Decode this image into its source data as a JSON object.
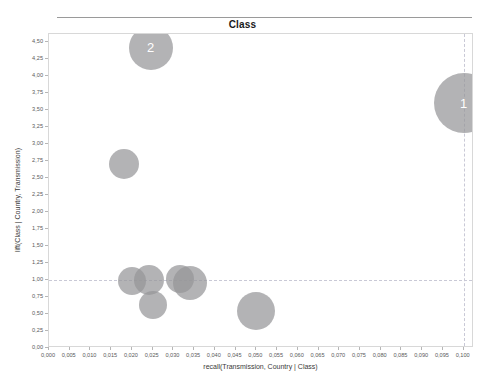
{
  "chart_data": {
    "type": "scatter",
    "title": "Class",
    "xlabel": "recall(Transmission, Country | Class)",
    "ylabel": "lift(Class | Country, Transmission)",
    "xlim": [
      0.0,
      0.1025
    ],
    "ylim": [
      0.0,
      4.62
    ],
    "grid": true,
    "grid_lines": {
      "horizontal": [
        1.0
      ],
      "vertical": [
        0.1
      ]
    },
    "legend": "none",
    "decimal_separator": ",",
    "xticks": [
      "0,000",
      "0,005",
      "0,010",
      "0,015",
      "0,020",
      "0,025",
      "0,030",
      "0,035",
      "0,040",
      "0,045",
      "0,050",
      "0,055",
      "0,060",
      "0,065",
      "0,070",
      "0,075",
      "0,080",
      "0,085",
      "0,090",
      "0,095",
      "0,100"
    ],
    "xtick_values": [
      0.0,
      0.005,
      0.01,
      0.015,
      0.02,
      0.025,
      0.03,
      0.035,
      0.04,
      0.045,
      0.05,
      0.055,
      0.06,
      0.065,
      0.07,
      0.075,
      0.08,
      0.085,
      0.09,
      0.095,
      0.1
    ],
    "yticks": [
      "0,00",
      "0,25",
      "0,50",
      "0,75",
      "1,00",
      "1,25",
      "1,50",
      "1,75",
      "2,00",
      "2,25",
      "2,50",
      "2,75",
      "3,00",
      "3,25",
      "3,50",
      "3,75",
      "4,00",
      "4,25",
      "4,50"
    ],
    "ytick_values": [
      0.0,
      0.25,
      0.5,
      0.75,
      1.0,
      1.25,
      1.5,
      1.75,
      2.0,
      2.25,
      2.5,
      2.75,
      3.0,
      3.25,
      3.5,
      3.75,
      4.0,
      4.25,
      4.5
    ],
    "bubble_color": "#969698",
    "bubble_opacity": 0.72,
    "label_color": "#ffffff",
    "points": [
      {
        "label": "1",
        "x": 0.1,
        "y": 3.6,
        "size": 30
      },
      {
        "label": "2",
        "x": 0.0245,
        "y": 4.42,
        "size": 22
      },
      {
        "label": "",
        "x": 0.018,
        "y": 2.7,
        "size": 15
      },
      {
        "label": "",
        "x": 0.02,
        "y": 0.98,
        "size": 14
      },
      {
        "label": "",
        "x": 0.024,
        "y": 1.0,
        "size": 15
      },
      {
        "label": "",
        "x": 0.025,
        "y": 0.64,
        "size": 14
      },
      {
        "label": "",
        "x": 0.0315,
        "y": 1.02,
        "size": 14
      },
      {
        "label": "",
        "x": 0.034,
        "y": 0.96,
        "size": 17
      },
      {
        "label": "",
        "x": 0.05,
        "y": 0.55,
        "size": 19
      }
    ]
  }
}
